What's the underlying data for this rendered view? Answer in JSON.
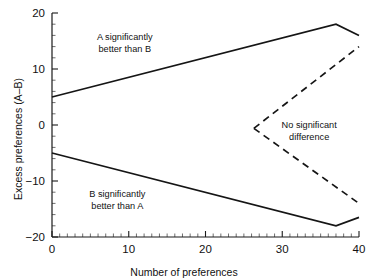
{
  "chart_data": {
    "type": "line",
    "title": "",
    "xlabel": "Number of preferences",
    "ylabel": "Excess preferences (A–B)",
    "xlim": [
      0,
      40
    ],
    "ylim": [
      -20,
      20
    ],
    "grid": false,
    "legend_position": "none",
    "x_ticks_major": [
      0,
      10,
      20,
      30,
      40
    ],
    "x_tick_labels": [
      "0",
      "10",
      "20",
      "30",
      "40"
    ],
    "x_tick_minor_step": 1,
    "y_ticks_major": [
      -20,
      -10,
      0,
      10,
      20
    ],
    "y_tick_labels": [
      "−20",
      "−10",
      "0",
      "10",
      "20"
    ],
    "y_tick_minor_step": 2,
    "series": [
      {
        "name": "Upper significance boundary (A better than B)",
        "style": "solid",
        "points": [
          [
            0,
            5
          ],
          [
            37,
            18
          ],
          [
            40,
            16
          ]
        ]
      },
      {
        "name": "Lower significance boundary (B better than A)",
        "style": "solid",
        "points": [
          [
            0,
            -5
          ],
          [
            37,
            -18
          ],
          [
            40,
            -16.5
          ]
        ]
      },
      {
        "name": "No significant difference upper boundary",
        "style": "dashed",
        "points": [
          [
            26.3,
            -0.6
          ],
          [
            40,
            14
          ]
        ]
      },
      {
        "name": "No significant difference lower boundary",
        "style": "dashed",
        "points": [
          [
            26.3,
            -0.6
          ],
          [
            40,
            -14
          ]
        ]
      }
    ],
    "annotations": [
      {
        "id": "region-a-better",
        "lines": [
          "A significantly",
          "better than B"
        ],
        "x": 9.5,
        "y": 14.5
      },
      {
        "id": "region-b-better",
        "lines": [
          "B significantly",
          "better than A"
        ],
        "x": 8.5,
        "y": -13.5
      },
      {
        "id": "region-no-difference",
        "lines": [
          "No significant",
          "difference"
        ],
        "x": 33.5,
        "y": -1.2
      }
    ]
  },
  "axes": {
    "x_title": "Number of preferences",
    "y_title": "Excess preferences (A–B)"
  }
}
